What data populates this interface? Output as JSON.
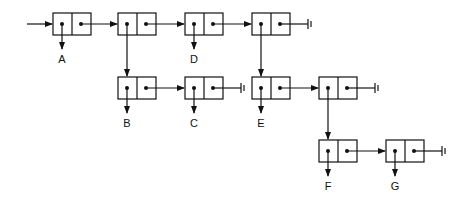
{
  "diagram": {
    "type": "linked-list-structure",
    "cells": [
      {
        "id": "c1",
        "x": 53,
        "y": 13,
        "car": "A"
      },
      {
        "id": "c2",
        "x": 118,
        "y": 13,
        "car": "c4"
      },
      {
        "id": "c3",
        "x": 185,
        "y": 13,
        "car": "D"
      },
      {
        "id": "c4",
        "x": 252,
        "y": 13,
        "car": "c6"
      },
      {
        "id": "c5",
        "x": 118,
        "y": 77,
        "car": "B"
      },
      {
        "id": "c6",
        "x": 185,
        "y": 77,
        "car": "C"
      },
      {
        "id": "c7",
        "x": 252,
        "y": 77,
        "car": "E"
      },
      {
        "id": "c8",
        "x": 319,
        "y": 77,
        "car": "c9"
      },
      {
        "id": "c9",
        "x": 319,
        "y": 140,
        "car": "F"
      },
      {
        "id": "c10",
        "x": 386,
        "y": 140,
        "car": "G"
      }
    ],
    "labels": [
      {
        "text": "A",
        "x": 63,
        "y": 78
      },
      {
        "text": "D",
        "x": 195,
        "y": 78
      },
      {
        "text": "B",
        "x": 128,
        "y": 141
      },
      {
        "text": "C",
        "x": 195,
        "y": 141
      },
      {
        "text": "E",
        "x": 262,
        "y": 141
      },
      {
        "text": "F",
        "x": 329,
        "y": 204
      },
      {
        "text": "G",
        "x": 396,
        "y": 204
      }
    ],
    "nil_symbol": "ground-terminator"
  }
}
